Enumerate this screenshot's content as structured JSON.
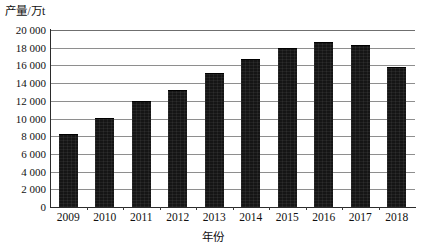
{
  "chart_data": {
    "type": "bar",
    "title": "",
    "xlabel": "年份",
    "ylabel": "产量/万t",
    "categories": [
      "2009",
      "2010",
      "2011",
      "2012",
      "2013",
      "2014",
      "2015",
      "2016",
      "2017",
      "2018"
    ],
    "values": [
      8100,
      9900,
      11900,
      13100,
      15000,
      16600,
      17800,
      18500,
      18200,
      15700
    ],
    "ylim": [
      0,
      20000
    ],
    "ytick_values": [
      0,
      2000,
      4000,
      6000,
      8000,
      10000,
      12000,
      14000,
      16000,
      18000,
      20000
    ],
    "ytick_labels": [
      "0",
      "2 000",
      "4 000",
      "6 000",
      "8 000",
      "10 000",
      "12 000",
      "14 000",
      "16 000",
      "18 000",
      "20 000"
    ],
    "grid": true,
    "legend": false,
    "bar_color": "#151515",
    "grid_color": "#8e8e8e",
    "axis_color": "#2b2b2b"
  }
}
